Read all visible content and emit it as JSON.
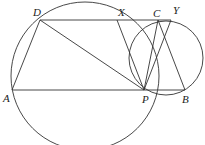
{
  "diagram": {
    "type": "geometry",
    "points": {
      "A": {
        "label": "A",
        "x": 12,
        "y": 90
      },
      "D": {
        "label": "D",
        "x": 40,
        "y": 20
      },
      "X": {
        "label": "X",
        "x": 117,
        "y": 20
      },
      "C": {
        "label": "C",
        "x": 158,
        "y": 20
      },
      "Y": {
        "label": "Y",
        "x": 171,
        "y": 20
      },
      "P": {
        "label": "P",
        "x": 144,
        "y": 90
      },
      "B": {
        "label": "B",
        "x": 185,
        "y": 90
      }
    },
    "circles": [
      {
        "name": "left-circle",
        "cx": 85,
        "cy": 76,
        "r": 74
      },
      {
        "name": "right-circle",
        "cx": 166,
        "cy": 58,
        "r": 37
      }
    ],
    "segments": [
      "D-Y",
      "A-P",
      "P-B",
      "A-D",
      "D-P",
      "X-P",
      "C-P",
      "Y-P",
      "C-B"
    ]
  }
}
